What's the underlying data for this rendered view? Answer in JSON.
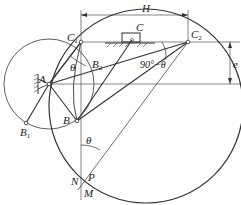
{
  "diagram": {
    "points": {
      "A": {
        "label": "A"
      },
      "B": {
        "label": "B"
      },
      "B1": {
        "label": "B",
        "sub": "1"
      },
      "B2": {
        "label": "B",
        "sub": "2"
      },
      "C": {
        "label": "C"
      },
      "C1": {
        "label": "C",
        "sub": "1"
      },
      "C2": {
        "label": "C",
        "sub": "2"
      },
      "P_top": {
        "label": "P"
      },
      "N": {
        "label": "N"
      },
      "P": {
        "label": "P"
      },
      "M": {
        "label": "M"
      }
    },
    "angles": {
      "theta_top": "θ",
      "ninety_minus_theta": "90°−θ",
      "theta_bottom": "θ"
    },
    "dimensions": {
      "stroke": "H",
      "offset": "e"
    },
    "colors": {
      "line": "#333333",
      "background": "#ffffff"
    }
  }
}
